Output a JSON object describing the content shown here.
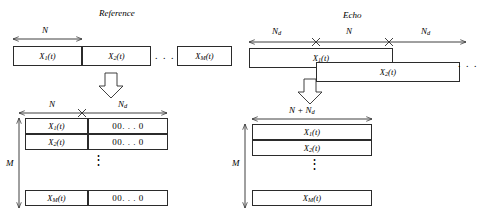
{
  "figure": {
    "panels": {
      "reference": {
        "title": "Reference",
        "top_dim": {
          "label": "N"
        },
        "top_boxes": [
          {
            "base": "X",
            "sub": "1",
            "tail": "(t)"
          },
          {
            "base": "X",
            "sub": "2",
            "tail": "(t)"
          },
          {
            "base": "X",
            "sub": "M",
            "tail": "(t)"
          }
        ],
        "top_ellipsis": ". . .",
        "arrow": "down-block-arrow",
        "bottom_dims": [
          {
            "label": "N"
          },
          {
            "label": "N",
            "sub": "d"
          }
        ],
        "row_bracket": {
          "label": "M"
        },
        "rows": [
          {
            "signal": {
              "base": "X",
              "sub": "1",
              "tail": "(t)"
            },
            "pad": "00. . . 0"
          },
          {
            "signal": {
              "base": "X",
              "sub": "2",
              "tail": "(t)"
            },
            "pad": "00. . . 0"
          },
          {
            "signal": {
              "base": "X",
              "sub": "M",
              "tail": "(t)"
            },
            "pad": "00. . . 0"
          }
        ],
        "row_ellipsis": "⋮"
      },
      "echo": {
        "title": "Echo",
        "top_dims": [
          {
            "label": "N",
            "sub": "d"
          },
          {
            "label": "N"
          },
          {
            "label": "N",
            "sub": "d"
          }
        ],
        "top_boxes": [
          {
            "base": "X",
            "sub": "1",
            "tail": "(t)"
          },
          {
            "base": "X",
            "sub": "2",
            "tail": "(t)"
          }
        ],
        "top_ellipsis": ". . .",
        "arrow": "down-block-arrow",
        "bottom_dim": {
          "text": "N + N",
          "sub": "d"
        },
        "row_bracket": {
          "label": "M"
        },
        "rows": [
          {
            "signal": {
              "base": "X",
              "sub": "1",
              "tail": "(t)"
            }
          },
          {
            "signal": {
              "base": "X",
              "sub": "2",
              "tail": "(t)"
            }
          },
          {
            "signal": {
              "base": "X",
              "sub": "M",
              "tail": "(t)"
            }
          }
        ],
        "row_ellipsis": "⋮"
      }
    },
    "colors": {
      "stroke": "#2b2b2b",
      "background": "#ffffff"
    }
  }
}
